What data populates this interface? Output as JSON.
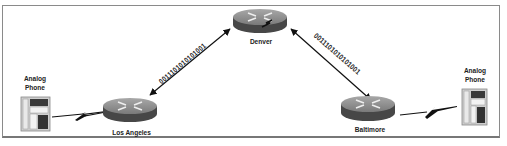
{
  "diagram": {
    "type": "network-topology",
    "nodes": [
      {
        "id": "denver",
        "label": "Denver",
        "kind": "router"
      },
      {
        "id": "los-angeles",
        "label": "Los Angeles",
        "kind": "router"
      },
      {
        "id": "baltimore",
        "label": "Baltimore",
        "kind": "router"
      },
      {
        "id": "phone-left",
        "label_line1": "Analog",
        "label_line2": "Phone",
        "kind": "analog-phone"
      },
      {
        "id": "phone-right",
        "label_line1": "Analog",
        "label_line2": "Phone",
        "kind": "analog-phone"
      }
    ],
    "links": [
      {
        "from": "los-angeles",
        "to": "denver",
        "style": "bidirectional-arrow",
        "label": "0011101010101001"
      },
      {
        "from": "denver",
        "to": "baltimore",
        "style": "bidirectional-arrow",
        "label": "0011101010101001"
      },
      {
        "from": "phone-left",
        "to": "los-angeles",
        "style": "lightning-bolt",
        "label": ""
      },
      {
        "from": "baltimore",
        "to": "phone-right",
        "style": "lightning-bolt",
        "label": ""
      }
    ]
  },
  "colors": {
    "router_top": "#8c8c8c",
    "router_side": "#4a4a4a",
    "router_mark": "#e8e8e8",
    "line": "#111111",
    "frame": "#8a8a8a"
  }
}
